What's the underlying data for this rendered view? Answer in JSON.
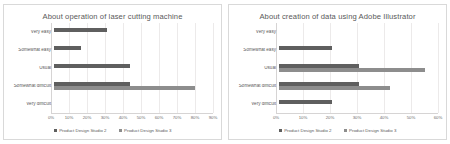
{
  "page": {
    "background": "#ffffff",
    "series_colors": {
      "studio2": "#5f5f5f",
      "studio3": "#8d8d8d"
    }
  },
  "charts": [
    {
      "title": "About operation of laser cutting machine",
      "legend": [
        {
          "label": "Product Design Studio 2",
          "color": "#5f5f5f"
        },
        {
          "label": "Product Design Studio 3",
          "color": "#8d8d8d"
        }
      ],
      "ticks": [
        "0%",
        "10%",
        "20%",
        "30%",
        "40%",
        "50%",
        "60%",
        "70%",
        "80%",
        "90%"
      ],
      "categories": [
        "Very easy",
        "Somewhat easy",
        "Usual",
        "Somewhat difficult",
        "Very difficult"
      ]
    },
    {
      "title": "About creation of data using Adobe Illustrator",
      "legend": [
        {
          "label": "Product Design Studio 2",
          "color": "#5f5f5f"
        },
        {
          "label": "Product Design Studio 3",
          "color": "#8d8d8d"
        }
      ],
      "ticks": [
        "0%",
        "10%",
        "20%",
        "30%",
        "40%",
        "50%",
        "60%"
      ],
      "categories": [
        "Very easy",
        "Somewhat easy",
        "Usual",
        "Somewhat difficult",
        "Very difficult"
      ]
    }
  ],
  "chart_data": [
    {
      "type": "bar",
      "orientation": "horizontal",
      "title": "About operation of laser cutting machine",
      "xlabel": "",
      "ylabel": "",
      "xlim": [
        0,
        90
      ],
      "grid": true,
      "legend_position": "bottom",
      "xticks": [
        0,
        10,
        20,
        30,
        40,
        50,
        60,
        70,
        80,
        90
      ],
      "xtick_labels": [
        "0%",
        "10%",
        "20%",
        "30%",
        "40%",
        "50%",
        "60%",
        "70%",
        "80%",
        "90%"
      ],
      "categories": [
        "Very easy",
        "Somewhat easy",
        "Usual",
        "Somewhat difficult",
        "Very difficult"
      ],
      "series": [
        {
          "name": "Product Design Studio 2",
          "color": "#5f5f5f",
          "values": [
            30,
            15,
            43,
            43,
            0
          ]
        },
        {
          "name": "Product Design Studio 3",
          "color": "#8d8d8d",
          "values": [
            0,
            0,
            0,
            80,
            0
          ]
        }
      ]
    },
    {
      "type": "bar",
      "orientation": "horizontal",
      "title": "About creation of data using Adobe Illustrator",
      "xlabel": "",
      "ylabel": "",
      "xlim": [
        0,
        60
      ],
      "grid": true,
      "legend_position": "bottom",
      "xticks": [
        0,
        10,
        20,
        30,
        40,
        50,
        60
      ],
      "xtick_labels": [
        "0%",
        "10%",
        "20%",
        "30%",
        "40%",
        "50%",
        "60%"
      ],
      "categories": [
        "Very easy",
        "Somewhat easy",
        "Usual",
        "Somewhat difficult",
        "Very difficult"
      ],
      "series": [
        {
          "name": "Product Design Studio 2",
          "color": "#5f5f5f",
          "values": [
            0,
            20,
            30,
            30,
            20
          ]
        },
        {
          "name": "Product Design Studio 3",
          "color": "#8d8d8d",
          "values": [
            0,
            0,
            55,
            42,
            0
          ]
        }
      ]
    }
  ]
}
